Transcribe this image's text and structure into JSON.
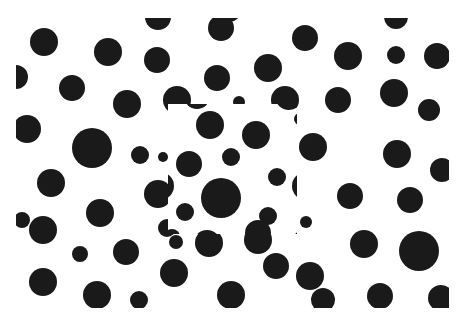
{
  "canvas": {
    "width": 467,
    "height": 320,
    "background": "#ffffff"
  },
  "dot_color": "#1a1a1a",
  "outer_field": {
    "clip": {
      "x": 16,
      "y": 18,
      "w": 433,
      "h": 290
    },
    "dots": [
      [
        44,
        42,
        14
      ],
      [
        108,
        52,
        14
      ],
      [
        158,
        17,
        13
      ],
      [
        157,
        60,
        13
      ],
      [
        221,
        28,
        13
      ],
      [
        305,
        38,
        13
      ],
      [
        348,
        56,
        14
      ],
      [
        396,
        55,
        9
      ],
      [
        437,
        56,
        13
      ],
      [
        396,
        17,
        12
      ],
      [
        16,
        77,
        12
      ],
      [
        72,
        88,
        13
      ],
      [
        127,
        104,
        14
      ],
      [
        217,
        78,
        13
      ],
      [
        268,
        68,
        14
      ],
      [
        177,
        100,
        14
      ],
      [
        239,
        102,
        6
      ],
      [
        285,
        100,
        14
      ],
      [
        338,
        100,
        13
      ],
      [
        394,
        93,
        14
      ],
      [
        429,
        110,
        11
      ],
      [
        27,
        129,
        14
      ],
      [
        92,
        148,
        20
      ],
      [
        140,
        155,
        9
      ],
      [
        199,
        140,
        8
      ],
      [
        163,
        157,
        5
      ],
      [
        239,
        146,
        5
      ],
      [
        313,
        147,
        14
      ],
      [
        397,
        154,
        14
      ],
      [
        442,
        170,
        12
      ],
      [
        51,
        183,
        14
      ],
      [
        100,
        213,
        14
      ],
      [
        158,
        194,
        14
      ],
      [
        167,
        228,
        9
      ],
      [
        220,
        198,
        20
      ],
      [
        272,
        202,
        8
      ],
      [
        306,
        222,
        6
      ],
      [
        350,
        196,
        13
      ],
      [
        410,
        200,
        13
      ],
      [
        43,
        230,
        14
      ],
      [
        80,
        254,
        8
      ],
      [
        126,
        252,
        13
      ],
      [
        176,
        242,
        7
      ],
      [
        209,
        243,
        14
      ],
      [
        258,
        240,
        14
      ],
      [
        310,
        276,
        14
      ],
      [
        364,
        244,
        14
      ],
      [
        419,
        251,
        20
      ],
      [
        43,
        282,
        14
      ],
      [
        97,
        295,
        14
      ],
      [
        139,
        300,
        9
      ],
      [
        174,
        273,
        14
      ],
      [
        231,
        295,
        14
      ],
      [
        276,
        266,
        13
      ],
      [
        323,
        300,
        12
      ],
      [
        380,
        296,
        13
      ],
      [
        441,
        298,
        13
      ],
      [
        230,
        12,
        10
      ],
      [
        22,
        220,
        8
      ],
      [
        0,
        270,
        12
      ]
    ]
  },
  "inner_field": {
    "clip": {
      "x": 168,
      "y": 104,
      "w": 129,
      "h": 130
    },
    "dots": [
      [
        210,
        125,
        14
      ],
      [
        256,
        135,
        14
      ],
      [
        189,
        164,
        13
      ],
      [
        231,
        157,
        9
      ],
      [
        277,
        177,
        9
      ],
      [
        221,
        198,
        20
      ],
      [
        185,
        212,
        9
      ],
      [
        268,
        216,
        9
      ],
      [
        160,
        186,
        14
      ],
      [
        306,
        186,
        14
      ],
      [
        300,
        119,
        6
      ],
      [
        162,
        149,
        6
      ],
      [
        306,
        243,
        14
      ],
      [
        172,
        237,
        8
      ],
      [
        207,
        244,
        14
      ],
      [
        258,
        233,
        13
      ],
      [
        197,
        96,
        13
      ],
      [
        244,
        96,
        8
      ],
      [
        289,
        96,
        14
      ]
    ]
  }
}
